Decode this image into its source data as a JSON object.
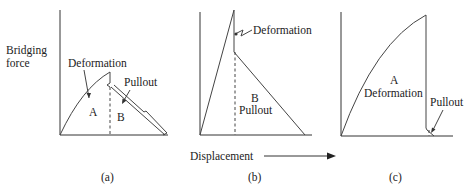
{
  "figure": {
    "y_axis_label_line1": "Bridging",
    "y_axis_label_line2": "force",
    "x_axis_label": "Displacement",
    "panels": [
      {
        "id": "a",
        "caption": "(a)",
        "labels": {
          "deformation": "Deformation",
          "pullout": "Pullout",
          "region_a": "A",
          "region_b": "B"
        }
      },
      {
        "id": "b",
        "caption": "(b)",
        "labels": {
          "deformation": "Deformation",
          "region_b": "B",
          "pullout": "Pullout"
        }
      },
      {
        "id": "c",
        "caption": "(c)",
        "labels": {
          "region_a": "A",
          "deformation": "Deformation",
          "pullout": "Pullout"
        }
      }
    ]
  },
  "colors": {
    "line": "#333333",
    "text": "#222222",
    "background": "#ffffff"
  }
}
